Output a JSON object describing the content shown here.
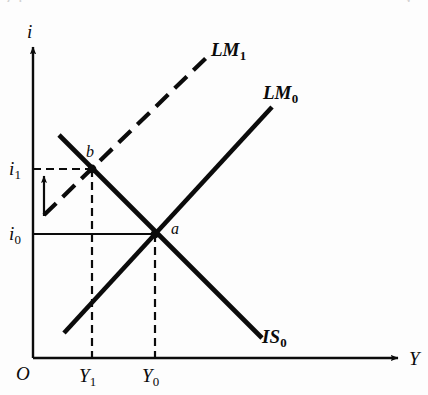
{
  "figure": {
    "kind": "is-lm-diagram",
    "background_color": "#fdfdfd",
    "ink_color": "#0b0b0b",
    "cropped_top_left_text": "( )",
    "cropped_top_right_text": "i"
  },
  "axes": {
    "y_axis_label": "i",
    "x_axis_label": "Y",
    "origin_label": "O",
    "x_range_px": [
      33,
      403
    ],
    "y_range_px": [
      42,
      358
    ]
  },
  "ticks": {
    "y": [
      {
        "label": "i",
        "sub": "1",
        "value_px": 169,
        "line_style": "dashed"
      },
      {
        "label": "i",
        "sub": "0",
        "value_px": 234,
        "line_style": "solid"
      }
    ],
    "x": [
      {
        "label": "Y",
        "sub": "1",
        "value_px": 92,
        "line_style": "dashed"
      },
      {
        "label": "Y",
        "sub": "0",
        "value_px": 155,
        "line_style": "dashed"
      }
    ]
  },
  "curves": [
    {
      "name": "LM1",
      "label": "LM",
      "sub": "1",
      "style": "dashed",
      "slope": "upward",
      "from_px": [
        44,
        215
      ],
      "to_px": [
        207,
        57
      ],
      "label_pos_px": [
        211,
        40
      ]
    },
    {
      "name": "LM0",
      "label": "LM",
      "sub": "0",
      "style": "solid",
      "slope": "upward",
      "from_px": [
        64,
        333
      ],
      "to_px": [
        272,
        107
      ],
      "label_pos_px": [
        263,
        83
      ]
    },
    {
      "name": "IS0",
      "label": "IS",
      "sub": "0",
      "style": "solid",
      "slope": "downward",
      "from_px": [
        59,
        135
      ],
      "to_px": [
        262,
        338
      ],
      "label_pos_px": [
        260,
        327
      ]
    }
  ],
  "points": [
    {
      "name": "b",
      "label": "b",
      "at_px": [
        92,
        169
      ],
      "label_pos_px": [
        86,
        145
      ],
      "meaning": "IS0 meets LM1"
    },
    {
      "name": "a",
      "label": "a",
      "at_px": [
        155,
        234
      ],
      "label_pos_px": [
        171,
        220
      ],
      "meaning": "IS0 meets LM0"
    }
  ],
  "annotations": [
    {
      "name": "interest-rate-rise-arrow",
      "direction": "up",
      "from_px": [
        44,
        216
      ],
      "to_px": [
        44,
        172
      ]
    }
  ]
}
